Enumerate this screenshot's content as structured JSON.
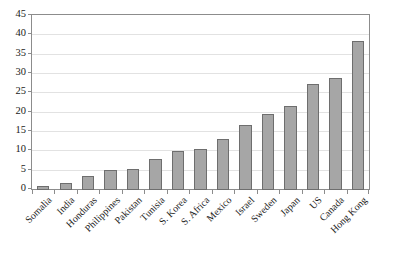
{
  "chart_data": {
    "type": "bar",
    "title": "",
    "subtitle": "",
    "xlabel": "",
    "ylabel": "",
    "ylim": [
      0,
      45
    ],
    "ytick_interval": 5,
    "yticks": [
      "45",
      "40",
      "35",
      "30",
      "25",
      "20",
      "15",
      "10",
      "5",
      "0"
    ],
    "grid": true,
    "legend": false,
    "legend_position": "none",
    "categories": [
      "Somalia",
      "India",
      "Honduras",
      "Philippines",
      "Pakistan",
      "Tunisia",
      "S. Korea",
      "S. Africa",
      "Mexico",
      "Israel",
      "Sweden",
      "Japan",
      "US",
      "Canada",
      "Hong Kong"
    ],
    "values": [
      1,
      1.9,
      3.5,
      5.1,
      5.4,
      7.9,
      10.1,
      10.5,
      13.3,
      16.9,
      19.6,
      21.7,
      27.5,
      28.9,
      38.5
    ],
    "bar_color": "#a6a6a6",
    "bar_border_color": "#6e6e6e",
    "gridline_color": "#e2e2e2",
    "axis_color": "#8c8c8c"
  }
}
